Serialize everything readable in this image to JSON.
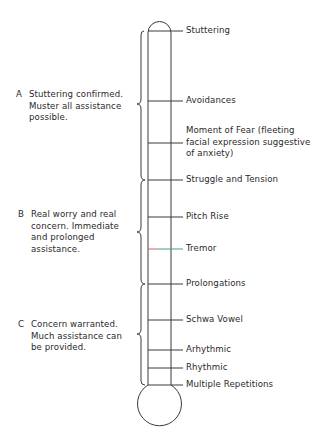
{
  "diagram": {
    "type": "thermometer-scale",
    "colors": {
      "line": "#3a3a3a",
      "text": "#2a2a2a",
      "tremor_tick_accent": "#d06060"
    },
    "stages": [
      {
        "label": "Stuttering",
        "y": 31
      },
      {
        "label": "Avoidances",
        "y": 101
      },
      {
        "label": "Moment of Fear (fleeting\nfacial expression suggestive\nof anxiety)",
        "y": 143
      },
      {
        "label": "Struggle and Tension",
        "y": 180
      },
      {
        "label": "Pitch Rise",
        "y": 217
      },
      {
        "label": "Tremor",
        "y": 249
      },
      {
        "label": "Prolongations",
        "y": 284
      },
      {
        "label": "Schwa Vowel",
        "y": 320
      },
      {
        "label": "Arhythmic",
        "y": 350
      },
      {
        "label": "Rhythmic",
        "y": 368
      },
      {
        "label": "Multiple Repetitions",
        "y": 385
      }
    ],
    "groups": [
      {
        "letter": "A",
        "text": "Stuttering confirmed.\nMuster all assistance\npossible.",
        "range": "Stuttering – Struggle and Tension"
      },
      {
        "letter": "B",
        "text": "Real worry and real\nconcern.  Immediate\nand prolonged\nassistance.",
        "range": "Struggle and Tension – Prolongations"
      },
      {
        "letter": "C",
        "text": "Concern warranted.\nMuch assistance can\nbe provided.",
        "range": "Prolongations – Multiple Repetitions"
      }
    ]
  }
}
